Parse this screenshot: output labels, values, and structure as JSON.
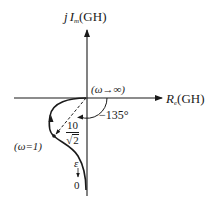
{
  "diagram": {
    "type": "nyquist-plot",
    "axes": {
      "imag_label_prefix": "j",
      "imag_label_I": "I",
      "imag_label_sub": "m",
      "imag_label_suffix": "(GH)",
      "real_label_R": "R",
      "real_label_sub": "e",
      "real_label_suffix": "(GH)"
    },
    "annotations": {
      "omega_inf": "(ω→∞)",
      "angle": "−135°",
      "omega_one": "(ω=1)",
      "magnitude_num": "10",
      "magnitude_den_root": "√",
      "magnitude_den_val": "2",
      "epsilon": "ε",
      "down_arrow": "↓",
      "zero": "0"
    },
    "colors": {
      "stroke": "#1a1a1a",
      "background": "#ffffff"
    }
  }
}
